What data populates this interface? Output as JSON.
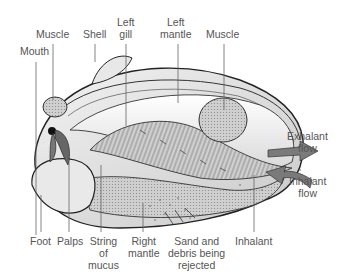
{
  "diagram": {
    "colors": {
      "label_text": "#555555",
      "leader_line": "#666666",
      "flow_arrow": "#7a7a7a",
      "outline": "#222222"
    },
    "labels": {
      "mouth": "Mouth",
      "muscle_front": "Muscle",
      "shell": "Shell",
      "left_gill_1": "Left",
      "left_gill_2": "gill",
      "left_mantle_1": "Left",
      "left_mantle_2": "mantle",
      "muscle_rear": "Muscle",
      "exhalant_flow_1": "Exhalant",
      "exhalant_flow_2": "flow",
      "inhalant_flow_1": "Inhalant",
      "inhalant_flow_2": "flow",
      "foot": "Foot",
      "palps": "Palps",
      "string_of_mucus_1": "String",
      "string_of_mucus_2": "of",
      "string_of_mucus_3": "mucus",
      "right_mantle_1": "Right",
      "right_mantle_2": "mantle",
      "sand_debris_1": "Sand and",
      "sand_debris_2": "debris being",
      "sand_debris_3": "rejected",
      "inhalant": "Inhalant"
    }
  }
}
